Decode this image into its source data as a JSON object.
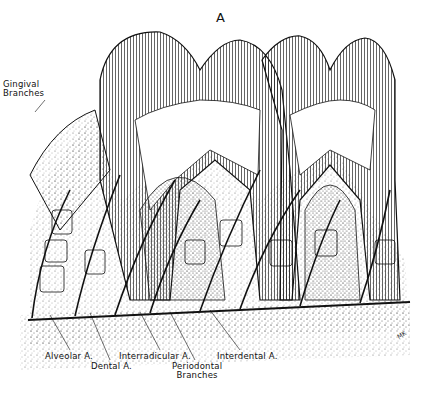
{
  "figure": {
    "panel_letter": "A",
    "signature": "MK",
    "colors": {
      "ink": "#111111",
      "paper": "#ffffff",
      "stipple": "#888888"
    }
  },
  "labels": {
    "gingival_branches": [
      "Gingival",
      "Branches"
    ],
    "alveolar_a": "Alveolar A.",
    "dental_a": "Dental A.",
    "interradicular_a": "Interradicular A.",
    "periodontal_branches": [
      "Periodontal",
      "Branches"
    ],
    "interdental_a": "Interdental A."
  }
}
